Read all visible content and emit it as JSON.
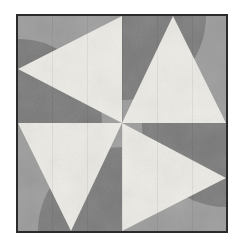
{
  "image": {
    "title": "Pinwheel Quilt Block",
    "kind": "quilt-block-pattern",
    "width": 243,
    "height": 249,
    "background": "#ffffff"
  },
  "frame": {
    "name": "block-border",
    "border_color": "#2b2b2b",
    "border_width": 2,
    "left": 16,
    "top": 14,
    "width": 212,
    "height": 219
  },
  "palette": {
    "light": "#eeece6",
    "medium": "#9a9a9a",
    "dark": "#787878",
    "outline": "#2b2b2b",
    "page": "#ffffff"
  },
  "geometry": {
    "view_width": 208,
    "view_height": 215,
    "center_x": 104,
    "center_y": 107,
    "arc_radius": 84
  },
  "quadrants": [
    {
      "name": "top-left",
      "background": "medium",
      "arc": {
        "fill": "dark",
        "pivot": "left-middle",
        "description": "quarter-disc bulging up-right from left edge"
      },
      "triangle": {
        "fill": "light",
        "points": "104,107 104,0 0,53",
        "apex": "center",
        "direction": "up-left"
      }
    },
    {
      "name": "top-right",
      "background": "medium",
      "arc": {
        "fill": "dark",
        "pivot": "top-middle",
        "description": "quarter-disc bulging down-right from top edge"
      },
      "triangle": {
        "fill": "light",
        "points": "104,107 208,107 155,0",
        "apex": "center",
        "direction": "up-right"
      }
    },
    {
      "name": "bottom-right",
      "background": "medium",
      "arc": {
        "fill": "dark",
        "pivot": "right-middle",
        "description": "quarter-disc bulging down-left from right edge"
      },
      "triangle": {
        "fill": "light",
        "points": "104,107 104,215 208,162",
        "apex": "center",
        "direction": "down-right"
      }
    },
    {
      "name": "bottom-left",
      "background": "medium",
      "arc": {
        "fill": "dark",
        "pivot": "bottom-middle",
        "description": "quarter-disc bulging up-left from bottom edge"
      },
      "triangle": {
        "fill": "light",
        "points": "104,107 0,107 53,215",
        "apex": "center",
        "direction": "down-left"
      }
    }
  ]
}
